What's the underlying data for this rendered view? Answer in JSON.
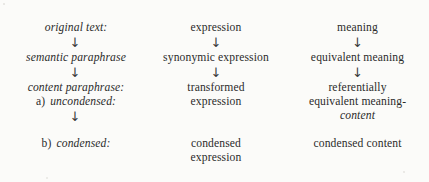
{
  "figure": {
    "type": "paraphrase-taxonomy-diagram",
    "arrow_glyph": "↓",
    "columns": [
      {
        "name": "stage-labels",
        "rows": [
          {
            "marker": "",
            "text": "original text:",
            "style": "italic"
          },
          {
            "marker": "",
            "text": "semantic paraphrase",
            "style": "italic"
          },
          {
            "marker": "",
            "text": "content paraphrase:",
            "style": "italic"
          },
          {
            "marker": "a)",
            "text": "uncondensed:",
            "style": "italic"
          },
          {
            "marker": "b)",
            "text": "condensed:",
            "style": "italic"
          }
        ]
      },
      {
        "name": "expression-level",
        "rows": [
          {
            "line1": "expression",
            "line2": ""
          },
          {
            "line1": "synonymic expression",
            "line2": ""
          },
          {
            "line1": "transformed",
            "line2": "expression"
          },
          {
            "line1": "condensed",
            "line2": "expression"
          }
        ]
      },
      {
        "name": "meaning-level",
        "rows": [
          {
            "line1": "meaning",
            "line2": "",
            "line3": ""
          },
          {
            "line1": "equivalent meaning",
            "line2": "",
            "line3": ""
          },
          {
            "line1": "referentially",
            "line2": "equivalent meaning-",
            "line3": "content"
          },
          {
            "line1": "condensed content",
            "line2": "",
            "line3": ""
          }
        ]
      }
    ]
  }
}
